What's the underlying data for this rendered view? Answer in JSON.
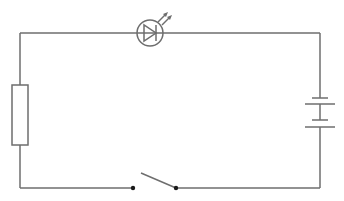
{
  "diagram": {
    "type": "circuit-schematic",
    "stroke_color": "#6e6e6e",
    "components": [
      {
        "id": "led",
        "name": "Light-emitting diode",
        "position": "top"
      },
      {
        "id": "resistor",
        "name": "Resistor",
        "position": "left"
      },
      {
        "id": "battery",
        "name": "Battery (2 cells)",
        "position": "right"
      },
      {
        "id": "switch",
        "name": "Switch (open)",
        "position": "bottom"
      }
    ]
  }
}
